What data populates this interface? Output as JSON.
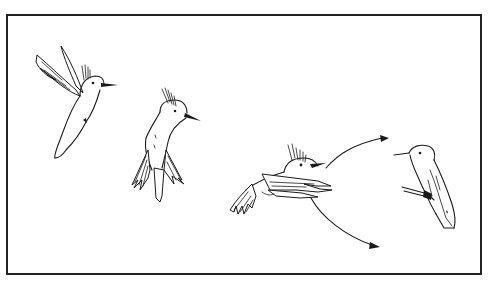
{
  "illustration": {
    "title": "Hummingbird flight sequence",
    "style": "black line drawing on white",
    "colors": {
      "background": "#ffffff",
      "line": "#1a1a1a",
      "frame": "#222222"
    },
    "frame": {
      "x": 6,
      "y": 14,
      "width": 476,
      "height": 261
    },
    "figures": [
      {
        "id": "bird-1",
        "pose": "hovering, wings raised",
        "position": "upper-left"
      },
      {
        "id": "bird-2",
        "pose": "hovering, wings down, tail fanned",
        "position": "left-center"
      },
      {
        "id": "bird-3",
        "pose": "forward flight, wings swept forward",
        "position": "center-right"
      },
      {
        "id": "bird-4",
        "pose": "perched on twig",
        "position": "right"
      }
    ],
    "arrows": [
      {
        "id": "arrow-upper",
        "from": "bird-3",
        "direction": "up-right"
      },
      {
        "id": "arrow-lower",
        "from": "bird-3",
        "direction": "down-right"
      }
    ]
  }
}
